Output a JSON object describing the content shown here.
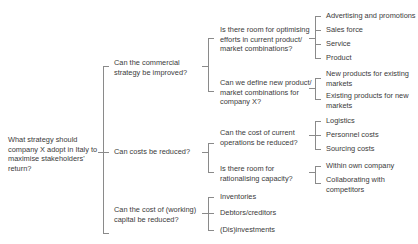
{
  "diagram": {
    "type": "issue-tree",
    "root": {
      "label": "What strategy should\ncompany X adopt in Italy to\nmaximise stakeholders'\nreturn?"
    },
    "level1": [
      {
        "label": "Can the commercial\nstrategy be improved?",
        "children": [
          {
            "label": "Is there room for optimising\nefforts in current product/\nmarket combinations?",
            "children": [
              "Advertising and promotions",
              "Sales force",
              "Service",
              "Product"
            ]
          },
          {
            "label": "Can we define new product/\nmarket combinations for\ncompany X?",
            "children": [
              "New products for existing\nmarkets",
              "Existing products for new\nmarkets"
            ]
          }
        ]
      },
      {
        "label": "Can costs be reduced?",
        "children": [
          {
            "label": "Can the cost of current\noperations be reduced?",
            "children": [
              "Logistics",
              "Personnel costs",
              "Sourcing costs"
            ]
          },
          {
            "label": "Is there room for\nrationalising capacity?",
            "children": [
              "Within own company",
              "Collaborating with\ncompetitors"
            ]
          }
        ]
      },
      {
        "label": "Can the cost of (working)\ncapital be reduced?",
        "children": [
          "Inventories",
          "Debtors/creditors",
          "(Dis)investments"
        ]
      }
    ],
    "colors": {
      "line": "#8a8a8a",
      "text": "#3a3a3a",
      "background": "#ffffff"
    }
  }
}
